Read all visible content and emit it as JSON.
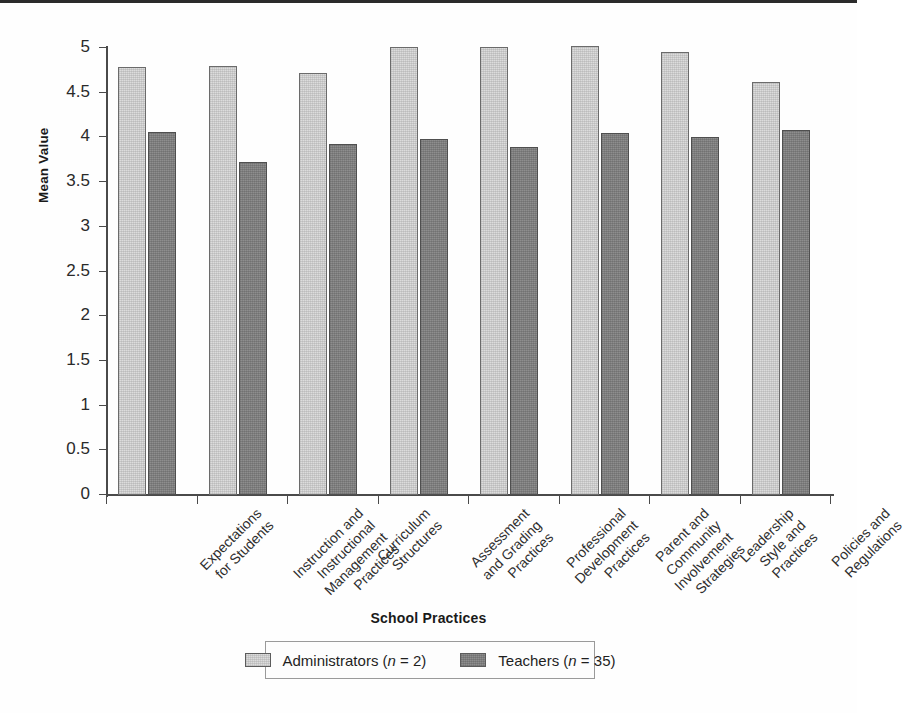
{
  "chart_data": {
    "type": "bar",
    "title": "",
    "xlabel": "School Practices",
    "ylabel": "Mean Value",
    "ylim": [
      0,
      5
    ],
    "grid": false,
    "legend_position": "bottom-center",
    "y_ticks": [
      "0",
      "0.5",
      "1",
      "1.5",
      "2",
      "2.5",
      "3",
      "3.5",
      "4",
      "4.5",
      "5"
    ],
    "y_tick_values": [
      0,
      0.5,
      1,
      1.5,
      2,
      2.5,
      3,
      3.5,
      4,
      4.5,
      5
    ],
    "categories": [
      "Expectations\nfor Students",
      "Instruction and\nInstructional\nManagement\nPractices",
      "Curriculum\nStructures",
      "Assessment\nand Grading\nPractices",
      "Professional\nDevelopment\nPractices",
      "Parent and\nCommunity\nInvolvement\nStrategies",
      "Leadership\nStyle and\nPractices",
      "Policies and\nRegulations"
    ],
    "category_lines": [
      [
        "Expectations",
        "for Students"
      ],
      [
        "Instruction and",
        "Instructional",
        "Management",
        "Practices"
      ],
      [
        "Curriculum",
        "Structures"
      ],
      [
        "Assessment",
        "and Grading",
        "Practices"
      ],
      [
        "Professional",
        "Development",
        "Practices"
      ],
      [
        "Parent and",
        "Community",
        "Involvement",
        "Strategies"
      ],
      [
        "Leadership",
        "Style and",
        "Practices"
      ],
      [
        "Policies and",
        "Regulations"
      ]
    ],
    "series": [
      {
        "name": "Administrators (n = 2)",
        "legend_text": "Administrators (n = 2)",
        "color": "#dcdcdc",
        "values": [
          4.79,
          4.8,
          4.72,
          5.01,
          5.01,
          5.02,
          4.96,
          4.62
        ]
      },
      {
        "name": "Teachers (n = 35)",
        "legend_text": "Teachers (n = 35)",
        "color": "#8e8e8e",
        "values": [
          4.06,
          3.72,
          3.93,
          3.98,
          3.89,
          4.05,
          4.0,
          4.08
        ]
      }
    ]
  },
  "legend": {
    "entries": [
      {
        "label_prefix": "Administrators (",
        "italic": "n",
        "label_suffix": " = 2)",
        "style": "admin"
      },
      {
        "label_prefix": "Teachers (",
        "italic": "n",
        "label_suffix": " = 35)",
        "style": "teacher"
      }
    ]
  },
  "colors": {
    "administrators": "#dcdcdc",
    "teachers": "#8e8e8e",
    "axis": "#4a4a4a",
    "text": "#1a1a1a",
    "background": "#ffffff"
  }
}
